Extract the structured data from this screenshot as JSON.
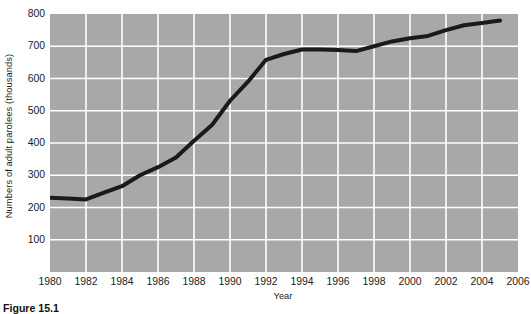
{
  "caption": "Figure 15.1",
  "chart_data": {
    "type": "line",
    "title": "",
    "xlabel": "Year",
    "ylabel": "Numbers of adult parolees (thousands)",
    "xlim": [
      1980,
      2006
    ],
    "ylim": [
      0,
      800
    ],
    "xticks": [
      1980,
      1982,
      1984,
      1986,
      1988,
      1990,
      1992,
      1994,
      1996,
      1998,
      2000,
      2002,
      2004,
      2006
    ],
    "xtick_labels": [
      "1980",
      "1982",
      "1984",
      "1986",
      "1988",
      "1990",
      "1992",
      "1994",
      "1996",
      "1998",
      "2000",
      "2002",
      "2004",
      "2006"
    ],
    "yticks": [
      100,
      200,
      300,
      400,
      500,
      600,
      700,
      800
    ],
    "ytick_labels": [
      "100",
      "200",
      "300",
      "400",
      "500",
      "600",
      "700",
      "800"
    ],
    "grid": "on",
    "grid_color": "#ffffff",
    "panel_color": "#a8a8a8",
    "line_color": "#1a1a1a",
    "line_width": 4,
    "legend": "none",
    "x": [
      1980,
      1981,
      1982,
      1983,
      1984,
      1985,
      1986,
      1987,
      1988,
      1989,
      1990,
      1991,
      1992,
      1993,
      1994,
      1995,
      1996,
      1997,
      1998,
      1999,
      2000,
      2001,
      2002,
      2003,
      2004,
      2005
    ],
    "values": [
      230,
      228,
      225,
      246,
      266,
      300,
      325,
      355,
      407,
      456,
      531,
      590,
      658,
      676,
      690,
      690,
      688,
      685,
      700,
      715,
      725,
      732,
      750,
      765,
      772,
      780
    ],
    "series": [
      {
        "name": "Adult parolees",
        "values": [
          230,
          228,
          225,
          246,
          266,
          300,
          325,
          355,
          407,
          456,
          531,
          590,
          658,
          676,
          690,
          690,
          688,
          685,
          700,
          715,
          725,
          732,
          750,
          765,
          772,
          780
        ]
      }
    ]
  }
}
